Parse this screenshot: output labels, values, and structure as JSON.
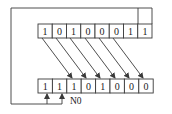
{
  "diagram": {
    "type": "shift-register",
    "top_register": {
      "bits": [
        "1",
        "0",
        "1",
        "0",
        "0",
        "0",
        "1",
        "1"
      ]
    },
    "bottom_register": {
      "bits": [
        "1",
        "1",
        "1",
        "0",
        "1",
        "0",
        "0",
        "0"
      ]
    },
    "shift_arrows": {
      "from_top_cells": [
        0,
        1,
        2,
        3,
        4,
        5
      ],
      "to_bottom_cells": [
        2,
        3,
        4,
        5,
        6,
        7
      ]
    },
    "feedback": {
      "from_top_cells": [
        6,
        7
      ],
      "to_bottom_cells": [
        0,
        1
      ]
    },
    "label": "N0",
    "colors": {
      "line": "#3a3a3a",
      "text": "#222222",
      "background": "#ffffff"
    }
  }
}
